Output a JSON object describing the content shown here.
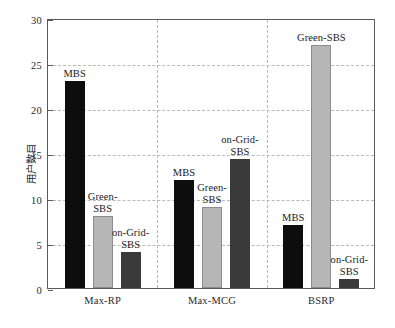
{
  "chart_data": {
    "type": "bar",
    "title": "",
    "xlabel": "",
    "ylabel": "用户数目",
    "ylim": [
      0,
      30
    ],
    "yticks": [
      0,
      5,
      10,
      15,
      20,
      25,
      30
    ],
    "ytick_labels": [
      "0",
      "5",
      "10",
      "15",
      "20",
      "25",
      "30"
    ],
    "grid": "dashed both axes",
    "legend": "none (per-bar text annotations)",
    "categories": [
      "Max-RP",
      "Max-MCG",
      "BSRP"
    ],
    "series": [
      {
        "name": "MBS",
        "color": "#0d0d0d",
        "values": [
          23,
          12,
          7
        ]
      },
      {
        "name": "Green-SBS",
        "color": "#b6b6b6",
        "values": [
          8,
          9,
          27
        ]
      },
      {
        "name": "on-Grid-SBS",
        "color": "#3a3a3a",
        "values": [
          4,
          14.3,
          1
        ]
      }
    ],
    "annotations": [
      {
        "text": "MBS",
        "group": "Max-RP",
        "series": "MBS"
      },
      {
        "text": "Green-\nSBS",
        "group": "Max-RP",
        "series": "Green-SBS"
      },
      {
        "text": "on-Grid-\nSBS",
        "group": "Max-RP",
        "series": "on-Grid-SBS"
      },
      {
        "text": "MBS",
        "group": "Max-MCG",
        "series": "MBS"
      },
      {
        "text": "Green-\nSBS",
        "group": "Max-MCG",
        "series": "Green-SBS"
      },
      {
        "text": "on-Grid-\nSBS",
        "group": "Max-MCG",
        "series": "on-Grid-SBS"
      },
      {
        "text": "MBS",
        "group": "BSRP",
        "series": "MBS"
      },
      {
        "text": "Green-SBS",
        "group": "BSRP",
        "series": "Green-SBS"
      },
      {
        "text": "on-Grid-\nSBS",
        "group": "BSRP",
        "series": "on-Grid-SBS"
      }
    ]
  },
  "caption": ""
}
